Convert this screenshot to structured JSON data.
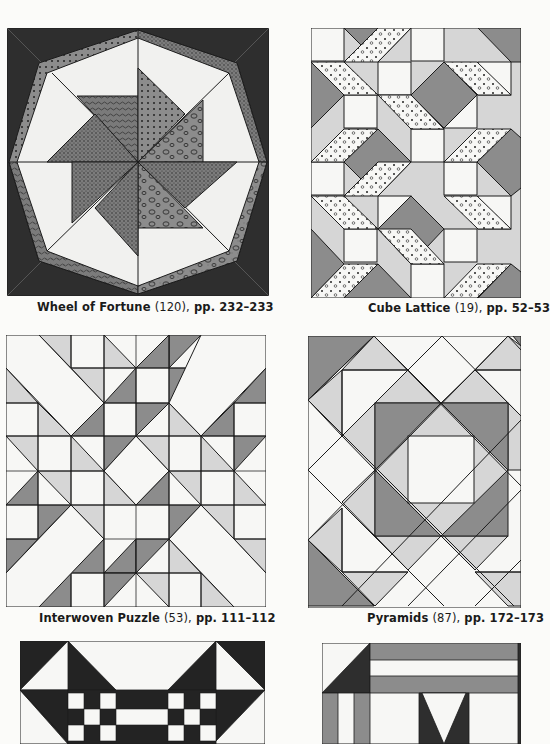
{
  "page": {
    "colors": {
      "dark": "#2e2e2e",
      "mid": "#8c8c8c",
      "light": "#d6d6d6",
      "white": "#f7f7f5",
      "line": "#1c1c1c"
    }
  },
  "quilts": [
    {
      "name": "Wheel of Fortune",
      "number": "(120),",
      "pages": "pp. 232–233"
    },
    {
      "name": "Cube Lattice",
      "number": "(19),",
      "pages": "pp. 52–53"
    },
    {
      "name": "Interwoven Puzzle",
      "number": "(53),",
      "pages": "pp. 111–112"
    },
    {
      "name": "Pyramids",
      "number": "(87),",
      "pages": "pp. 172–173"
    },
    {
      "name": "",
      "number": "",
      "pages": ""
    },
    {
      "name": "",
      "number": "",
      "pages": ""
    }
  ]
}
